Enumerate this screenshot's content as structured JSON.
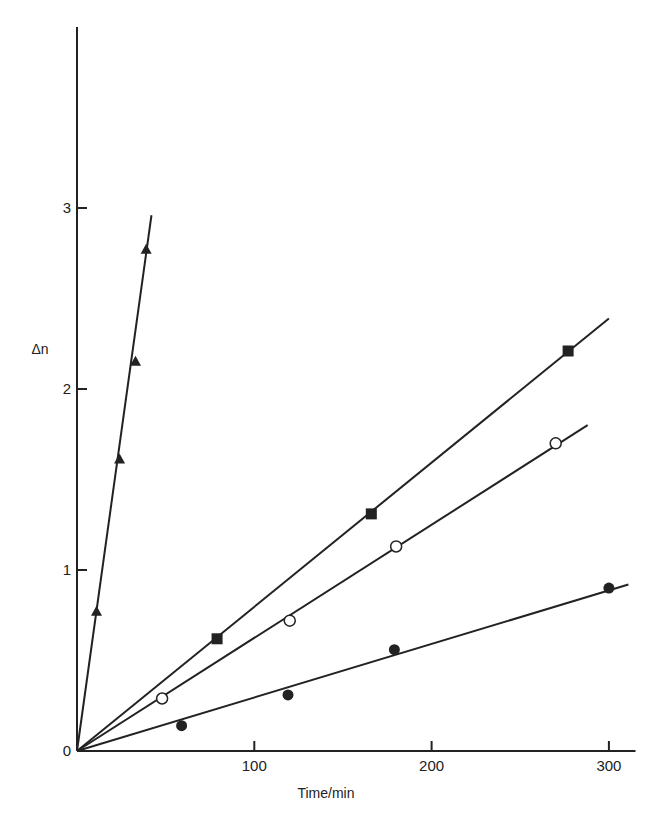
{
  "chart_data": {
    "type": "scatter",
    "title": "",
    "xlabel": "Time/min",
    "ylabel": "Δn",
    "xlim": [
      0,
      315
    ],
    "ylim": [
      0,
      4
    ],
    "x_ticks": [
      100,
      200,
      300
    ],
    "x_tick_labels": [
      "100",
      "200",
      "300"
    ],
    "y_ticks": [
      0,
      1,
      2,
      3
    ],
    "y_tick_labels": [
      "0",
      "1",
      "2",
      "3"
    ],
    "grid": false,
    "legend": null,
    "series": [
      {
        "name": "filled triangles",
        "marker": "triangle-filled",
        "x": [
          11,
          24,
          33,
          39
        ],
        "y": [
          0.77,
          1.61,
          2.15,
          2.77
        ],
        "fit_line": {
          "x": [
            0,
            42
          ],
          "y": [
            0,
            2.96
          ]
        }
      },
      {
        "name": "filled squares",
        "marker": "square-filled",
        "x": [
          79,
          166,
          277
        ],
        "y": [
          0.62,
          1.31,
          2.21
        ],
        "fit_line": {
          "x": [
            0,
            300
          ],
          "y": [
            0,
            2.39
          ]
        }
      },
      {
        "name": "open circles",
        "marker": "circle-open",
        "x": [
          48,
          120,
          180,
          270
        ],
        "y": [
          0.29,
          0.72,
          1.13,
          1.7
        ],
        "fit_line": {
          "x": [
            0,
            288
          ],
          "y": [
            0,
            1.8
          ]
        }
      },
      {
        "name": "filled circles",
        "marker": "circle-filled",
        "x": [
          59,
          119,
          179,
          300
        ],
        "y": [
          0.14,
          0.31,
          0.56,
          0.9
        ],
        "fit_line": {
          "x": [
            0,
            311
          ],
          "y": [
            0,
            0.92
          ]
        }
      }
    ]
  },
  "colors": {
    "ink": "#222222",
    "background": "#ffffff"
  }
}
